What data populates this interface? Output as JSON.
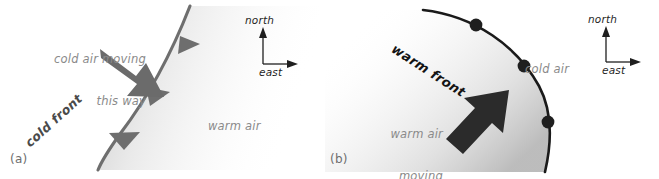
{
  "figure": {
    "panels": [
      {
        "tag": "(a)",
        "front_label": "cold front",
        "front_type": "cold",
        "front_color": "#6e6e6e",
        "barb_shape": "triangle",
        "barb_count": 3,
        "air_mass_label": "warm air",
        "motion_lines": [
          "cold air moving",
          "this way"
        ],
        "motion_text_align": "right",
        "arrow_direction": "southeast",
        "arrow_color": "#6b6b6b",
        "compass": {
          "north": "north",
          "east": "east"
        }
      },
      {
        "tag": "(b)",
        "front_label": "warm front",
        "front_type": "warm",
        "front_color": "#1a1a1a",
        "barb_shape": "semicircle",
        "barb_count": 3,
        "air_mass_label": "cold air",
        "motion_lines": [
          "warm air",
          "moving",
          "that way"
        ],
        "motion_text_align": "right",
        "arrow_direction": "northeast",
        "arrow_color": "#2b2b2b",
        "compass": {
          "north": "north",
          "east": "east"
        }
      }
    ]
  }
}
